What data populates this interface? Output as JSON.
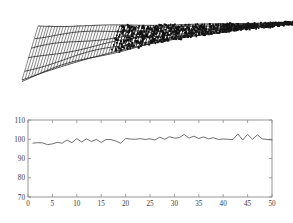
{
  "figure": {
    "title": "",
    "background": "#ffffff",
    "panel_count": 2
  },
  "surface_plot": {
    "name": "waterfall-surface-plot",
    "type": "surface",
    "description": "3D waterfall mesh surface tapering to a point at right",
    "axis_visible": false,
    "tick_labels": [],
    "mesh_color": "#1a1a1a",
    "ridge_count": 96,
    "view": "rotated 3D perspective"
  },
  "chart_data": {
    "type": "line",
    "title": "",
    "xlabel": "",
    "ylabel": "",
    "xlim": [
      0,
      50
    ],
    "ylim": [
      70,
      110
    ],
    "grid": false,
    "legend": null,
    "line_color": "#555555",
    "xticks": [
      0,
      5,
      10,
      15,
      20,
      25,
      30,
      35,
      40,
      45,
      50
    ],
    "yticks": [
      70,
      80,
      90,
      100,
      110
    ],
    "x": [
      1,
      2,
      3,
      4,
      5,
      6,
      7,
      8,
      9,
      10,
      11,
      12,
      13,
      14,
      15,
      16,
      17,
      18,
      19,
      20,
      21,
      22,
      23,
      24,
      25,
      26,
      27,
      28,
      29,
      30,
      31,
      32,
      33,
      34,
      35,
      36,
      37,
      38,
      39,
      40,
      41,
      42,
      43,
      44,
      45,
      46,
      47,
      48,
      49,
      50
    ],
    "series": [
      {
        "name": "signal",
        "values": [
          98.0,
          98.2,
          98.1,
          97.2,
          97.6,
          98.4,
          98.0,
          99.6,
          98.2,
          100.3,
          98.6,
          100.2,
          98.8,
          99.9,
          98.3,
          99.9,
          99.8,
          99.1,
          97.9,
          100.4,
          100.1,
          100.0,
          100.3,
          99.9,
          100.2,
          99.6,
          101.1,
          100.0,
          101.3,
          100.6,
          100.8,
          102.5,
          100.6,
          101.6,
          100.4,
          101.2,
          100.2,
          100.8,
          99.9,
          100.1,
          100.0,
          99.8,
          102.8,
          99.6,
          102.5,
          100.0,
          102.3,
          100.2,
          99.9,
          99.6
        ]
      }
    ]
  },
  "ticks": {
    "x": [
      "0",
      "5",
      "10",
      "15",
      "20",
      "25",
      "30",
      "35",
      "40",
      "45",
      "50"
    ],
    "y": [
      "110",
      "100",
      "90",
      "80",
      "70"
    ]
  }
}
